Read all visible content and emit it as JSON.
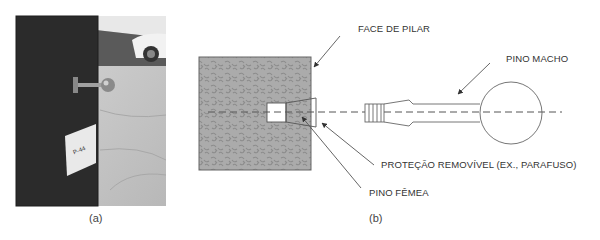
{
  "figure": {
    "panel_a": {
      "caption": "(a)",
      "photo": {
        "description": "Photo of dark pillar with metal ball-end pin protruding, white sign on pillar, parking garage floor and car in background",
        "sign_text": "P-44"
      }
    },
    "panel_b": {
      "caption": "(b)",
      "labels": {
        "face_de_pilar": "FACE DE PILAR",
        "pino_macho": "PINO MACHO",
        "protecao_removivel": "PROTEÇÃO REMOVÍVEL (EX., PARAFUSO)",
        "pino_femea": "PINO FÊMEA"
      }
    },
    "colors": {
      "pillar_fill": "#a9a9a9",
      "pillar_texture": "#8a8a8a",
      "line": "#555555",
      "photo_dark": "#2b2b2b",
      "photo_floor": "#c8c8c8"
    }
  }
}
